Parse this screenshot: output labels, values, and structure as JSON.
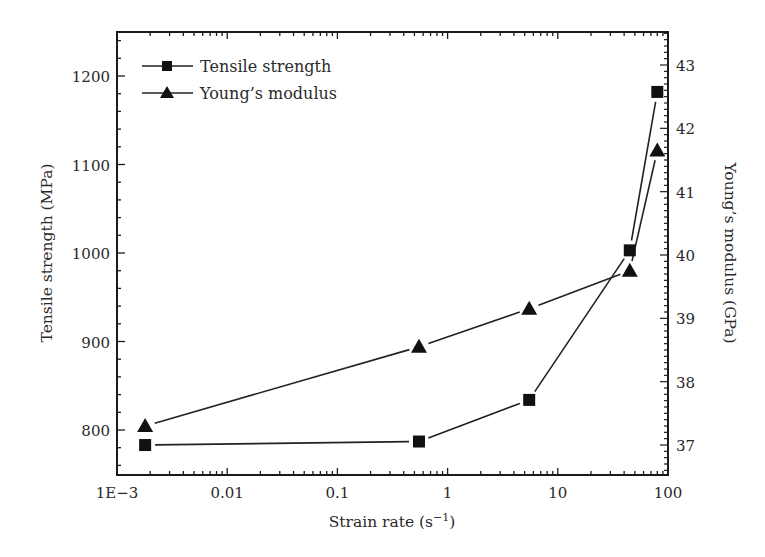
{
  "chart_data": {
    "type": "line",
    "title": "",
    "xlabel": "Strain rate (s⁻¹)",
    "xlabel_base": "Strain rate (s",
    "xlabel_sup": "−1",
    "xlabel_close": ")",
    "ylabel": "Tensile strength (MPa)",
    "y2label": "Young’s modulus (GPa)",
    "xscale": "log",
    "xlim": [
      0.001,
      100
    ],
    "ylim": [
      750,
      1250
    ],
    "y2lim": [
      36.4,
      43.5
    ],
    "x_ticks": [
      0.001,
      0.01,
      0.1,
      1,
      10,
      100
    ],
    "x_tick_labels": [
      "1E−3",
      "0.01",
      "0.1",
      "1",
      "10",
      "100"
    ],
    "y_ticks": [
      800,
      900,
      1000,
      1100,
      1200
    ],
    "y_tick_labels": [
      "800",
      "900",
      "1000",
      "1100",
      "1200"
    ],
    "y2_ticks": [
      37,
      38,
      39,
      40,
      41,
      42,
      43
    ],
    "y2_tick_labels": [
      "37",
      "38",
      "39",
      "40",
      "41",
      "42",
      "43"
    ],
    "grid": false,
    "legend_position": "upper left",
    "series": [
      {
        "name": "Tensile strength",
        "marker": "square",
        "axis": "left",
        "x": [
          0.0018,
          0.55,
          5.5,
          45,
          80
        ],
        "values": [
          783,
          787,
          834,
          1003,
          1182
        ]
      },
      {
        "name": "Young’s modulus",
        "marker": "triangle",
        "axis": "right",
        "x": [
          0.0018,
          0.55,
          5.5,
          45,
          80
        ],
        "values": [
          37.3,
          38.55,
          39.15,
          39.75,
          41.65
        ]
      }
    ]
  },
  "colors": {
    "line": "#222222",
    "marker": "#111111",
    "axis": "#1a1a1a",
    "text": "#2a2a2a"
  }
}
